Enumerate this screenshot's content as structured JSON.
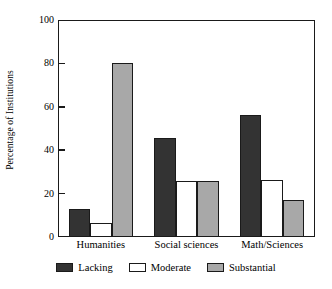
{
  "chart_data": {
    "type": "bar",
    "title": "",
    "subtitle": "",
    "xlabel": "",
    "ylabel": "Percentage of Institutions",
    "categories": [
      "Humanities",
      "Social sciences",
      "Math/Sciences"
    ],
    "series": [
      {
        "name": "Lacking",
        "values": [
          13,
          45.5,
          56
        ],
        "color": "#333333"
      },
      {
        "name": "Moderate",
        "values": [
          6.5,
          26,
          26.5
        ],
        "color": "#ffffff"
      },
      {
        "name": "Substantial",
        "values": [
          80,
          26,
          17
        ],
        "color": "#a8a8a8"
      }
    ],
    "ylim": [
      0,
      100
    ],
    "yticks": [
      0,
      20,
      40,
      60,
      80,
      100
    ],
    "ytick_labels": [
      "0",
      "20",
      "40",
      "60",
      "80",
      "100"
    ],
    "grid": false,
    "legend_position": "bottom",
    "frame": true,
    "axis_color": "#1a1a1a",
    "background": "#ffffff"
  },
  "legend": {
    "items": [
      {
        "label": "Lacking",
        "color": "#333333"
      },
      {
        "label": "Moderate",
        "color": "#ffffff"
      },
      {
        "label": "Substantial",
        "color": "#a8a8a8"
      }
    ]
  }
}
